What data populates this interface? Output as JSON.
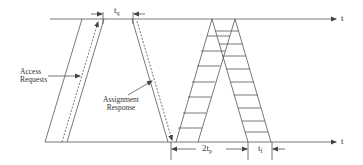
{
  "diagram": {
    "type": "timing-diagram",
    "axes": {
      "top": {
        "label": "t"
      },
      "bottom": {
        "label": "t"
      }
    },
    "labels": {
      "access_requests_line1": "Access",
      "access_requests_line2": "Requests",
      "assignment_response_line1": "Assignment",
      "assignment_response_line2": "Response",
      "tq_base": "t",
      "tq_sub": "q",
      "two_tp_base": "2t",
      "two_tp_sub": "p",
      "tf_base": "t",
      "tf_sub": "f"
    },
    "colors": {
      "line": "#555555",
      "text": "#333333",
      "background": "#ffffff"
    }
  }
}
